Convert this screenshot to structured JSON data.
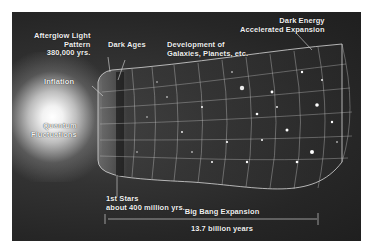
{
  "diagram": {
    "labels": {
      "afterglow": [
        "Afterglow Light",
        "Pattern",
        "380,000 yrs."
      ],
      "dark_ages": "Dark Ages",
      "development": [
        "Development of",
        "Galaxies, Planets, etc."
      ],
      "dark_energy": [
        "Dark Energy",
        "Accelerated Expansion"
      ],
      "inflation": "Inflation",
      "quantum": [
        "Quantum",
        "Fluctuations"
      ],
      "first_stars": [
        "1st Stars",
        "about 400 million yrs."
      ],
      "expansion": "Big Bang Expansion",
      "duration": "13.7 billion years"
    },
    "colors": {
      "background": "#262626",
      "text": "#f0f0f0",
      "grid": "#cfcfcf",
      "page": "#ffffff"
    }
  }
}
